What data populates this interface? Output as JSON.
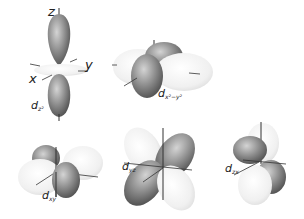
{
  "diagram": {
    "title": "",
    "orbitals": [
      {
        "id": "dz2",
        "label": "d",
        "subscript": "z²",
        "axes": [
          "z",
          "x",
          "y"
        ]
      },
      {
        "id": "dx2-y2",
        "label": "d",
        "subscript": "x²−y²"
      },
      {
        "id": "dxy",
        "label": "d",
        "subscript": "xy"
      },
      {
        "id": "dyz",
        "label": "d",
        "subscript": "yz"
      },
      {
        "id": "dzx",
        "label": "d",
        "subscript": "zx"
      }
    ],
    "axis_labels": {
      "z": "z",
      "x": "x",
      "y": "y"
    },
    "colors": {
      "dark_lobe": "#7a7a7a",
      "light_lobe": "#ececec",
      "axis": "#333333"
    }
  }
}
